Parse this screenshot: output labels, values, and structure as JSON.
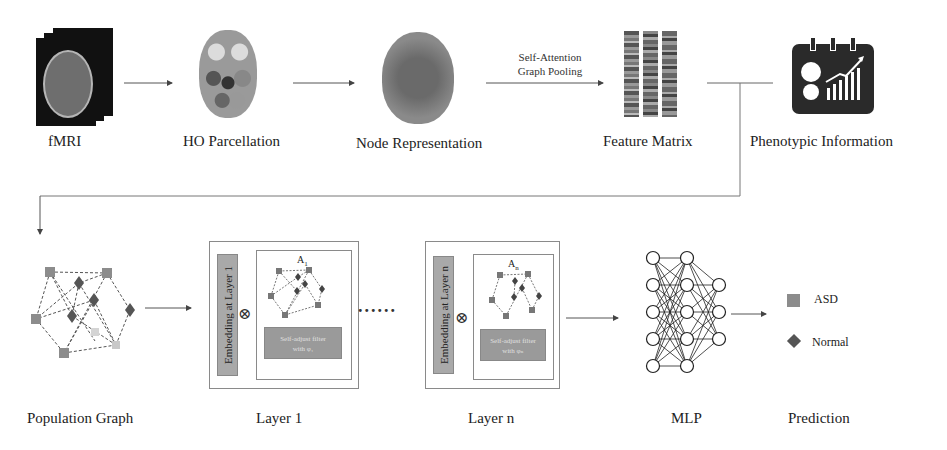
{
  "top_row": {
    "fmri": {
      "label": "fMRI",
      "icon": "fmri-scan-stack-icon"
    },
    "ho_parcellation": {
      "label": "HO Parcellation",
      "icon": "parcellated-brain-icon"
    },
    "node_representation": {
      "label": "Node Representation",
      "icon": "brain-nodes-icon"
    },
    "pooling_arrow": {
      "line1": "Self-Attention",
      "line2": "Graph Pooling"
    },
    "feature_matrix": {
      "label": "Feature Matrix",
      "icon": "feature-matrix-icon",
      "columns": 3
    },
    "phenotypic": {
      "label": "Phenotypic Information",
      "icon": "phenotypic-calendar-chart-icon"
    }
  },
  "bottom_row": {
    "population_graph": {
      "label": "Population Graph"
    },
    "layer1": {
      "label": "Layer 1",
      "embedding": "Embedding at Layer 1",
      "operator": "⊗",
      "adjacency": "A",
      "adjacency_sub": "1",
      "filter_line1": "Self-adjust filter",
      "filter_line2": "with φ₁"
    },
    "ellipsis": "......",
    "layern": {
      "label": "Layer n",
      "embedding": "Embedding at Layer n",
      "operator": "⊗",
      "adjacency": "A",
      "adjacency_sub": "n",
      "filter_line1": "Self-adjust filter",
      "filter_line2": "with φₙ"
    },
    "mlp": {
      "label": "MLP",
      "layers": [
        5,
        5,
        3
      ]
    },
    "prediction": {
      "label": "Prediction",
      "legend": [
        {
          "shape": "square",
          "text": "ASD",
          "color": "#8c8c8c"
        },
        {
          "shape": "diamond",
          "text": "Normal",
          "color": "#555555"
        }
      ]
    }
  },
  "colors": {
    "line": "#555555",
    "box_border": "#8a8a8a",
    "embed_bar": "#a9a9a9",
    "filter_box": "#9a9a9a",
    "asd_node": "#8c8c8c",
    "normal_node": "#555555",
    "icon_dark": "#2a2a2a"
  }
}
